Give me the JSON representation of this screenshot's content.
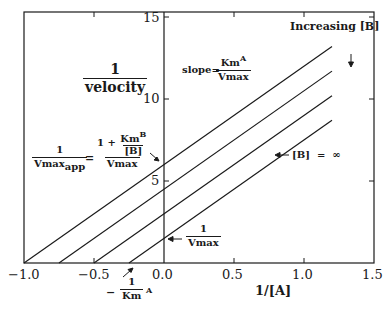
{
  "chart_data": {
    "type": "line",
    "title": "",
    "xlabel": "1/[A]",
    "ylabel": "1 / velocity",
    "xlim": [
      -1.0,
      1.5
    ],
    "ylim": [
      0,
      15
    ],
    "x_ticks": [
      "-1.0",
      "-0.5",
      "0.0",
      "0.5",
      "1.0",
      "1.5"
    ],
    "y_ticks": [
      "5",
      "10",
      "15"
    ],
    "grid": false,
    "legend": null,
    "series": [
      {
        "name": "lowest [B]",
        "x": [
          -1.0,
          1.2
        ],
        "y": [
          0,
          13.2
        ],
        "y_intercept": 6.0,
        "x_intercept": -1.0,
        "slope": 6
      },
      {
        "name": "[B] 2",
        "x": [
          -0.75,
          1.2
        ],
        "y": [
          0,
          11.7
        ],
        "y_intercept": 4.5,
        "x_intercept": -0.75,
        "slope": 6
      },
      {
        "name": "[B] 3",
        "x": [
          -0.5,
          1.2
        ],
        "y": [
          0,
          10.2
        ],
        "y_intercept": 3.0,
        "x_intercept": -0.5,
        "slope": 6
      },
      {
        "name": "[B] = ∞",
        "x": [
          -0.25,
          1.2
        ],
        "y": [
          0,
          8.7
        ],
        "y_intercept": 1.5,
        "x_intercept": -0.25,
        "slope": 6
      }
    ],
    "annotations": [
      {
        "text": "Increasing [B]",
        "arrow": "down"
      },
      {
        "text": "slope = Km^A / Vmax"
      },
      {
        "text": "1/Vmax_app = (1 + Km^B/[B]) / Vmax",
        "points_to": "y-intercept of top line"
      },
      {
        "text": "[B] = ∞",
        "points_to": "lowest line"
      },
      {
        "text": "1/Vmax",
        "points_to": "y-intercept of [B]=∞ line"
      },
      {
        "text": "-1/Km^A",
        "points_to": "x-intercept of [B]=∞ line"
      }
    ]
  },
  "labels": {
    "y_title_num": "1",
    "y_title_den": "velocity",
    "x_title": "1/[A]",
    "increasing": "Increasing [B]",
    "down_arrow": "↓",
    "slope_prefix": "slope=",
    "slope_num": "Km",
    "slope_num_sup": "A",
    "slope_den": "Vmax",
    "vapp_num": "1",
    "vapp_den": "Vmax",
    "vapp_den_sub": "app",
    "equals": "=",
    "vapp_rhs_one": "1 + ",
    "vapp_rhs_km": "Km",
    "vapp_rhs_km_sup": "B",
    "vapp_rhs_b": "[B]",
    "vapp_rhs_den": "Vmax",
    "binf": "[B]  =  ∞",
    "vmax_num": "1",
    "vmax_den": "Vmax",
    "kma_minus": "−",
    "kma_num": "1",
    "kma_den": "Km",
    "kma_sup": "A"
  },
  "ticks": {
    "x": [
      {
        "label": "−1.0",
        "px": 24
      },
      {
        "label": "−0.5",
        "px": 94
      },
      {
        "label": "0.0",
        "px": 164
      },
      {
        "label": "0.5",
        "px": 234
      },
      {
        "label": "1.0",
        "px": 304
      },
      {
        "label": "1.5",
        "px": 374
      }
    ],
    "y": [
      {
        "label": "5",
        "py": 181
      },
      {
        "label": "10",
        "py": 99
      },
      {
        "label": "15",
        "py": 18
      }
    ]
  }
}
